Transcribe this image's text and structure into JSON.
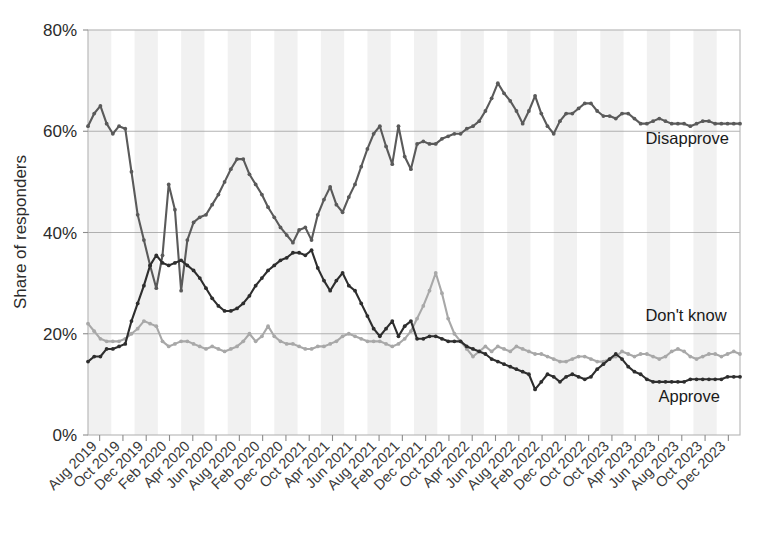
{
  "chart_data": {
    "type": "line",
    "title": "",
    "xlabel": "",
    "ylabel": "Share of responders",
    "ylim": [
      0,
      80
    ],
    "yticks": [
      0,
      20,
      40,
      60,
      80
    ],
    "ytick_labels": [
      "0%",
      "20%",
      "40%",
      "60%",
      "80%"
    ],
    "grid": true,
    "legend_position": "inline-right",
    "x_tick_labels": [
      "Aug 2019",
      "Oct 2019",
      "Dec 2019",
      "Feb 2020",
      "Apr 2020",
      "Jun 2020",
      "Aug 2020",
      "Feb 2020",
      "Dec 2020",
      "Oct 2021",
      "Apr 2021",
      "Jun 2021",
      "Aug 2021",
      "Feb 2021",
      "Dec 2021",
      "Oct 2022",
      "Apr 2022",
      "Jun 2022",
      "Aug 2022",
      "Feb 2022",
      "Dec 2022",
      "Oct 2022",
      "Oct 2023",
      "Apr 2023",
      "Jun 2023",
      "Aug 2023",
      "Oct 2023",
      "Dec 2023"
    ],
    "x_index": [
      0,
      1,
      2,
      3,
      4,
      5,
      6,
      7,
      8,
      9,
      10,
      11,
      12,
      13,
      14,
      15,
      16,
      17,
      18,
      19,
      20,
      21,
      22,
      23,
      24,
      25,
      26,
      27,
      28,
      29,
      30,
      31,
      32,
      33,
      34,
      35,
      36,
      37,
      38,
      39,
      40,
      41,
      42,
      43,
      44,
      45,
      46,
      47,
      48,
      49,
      50,
      51,
      52,
      53,
      54,
      55,
      56,
      57,
      58,
      59,
      60,
      61,
      62,
      63,
      64,
      65,
      66,
      67,
      68,
      69,
      70,
      71,
      72,
      73,
      74,
      75,
      76,
      77,
      78,
      79,
      80,
      81,
      82,
      83,
      84,
      85,
      86,
      87,
      88,
      89,
      90,
      91,
      92,
      93,
      94,
      95,
      96,
      97,
      98,
      99,
      100,
      101,
      102,
      103,
      104,
      105
    ],
    "series": [
      {
        "name": "Disapprove",
        "color": "#5a5a5a",
        "label_x_frac": 0.855,
        "label_y_value": 57.5,
        "values": [
          61.0,
          63.5,
          65.0,
          61.5,
          59.5,
          61.0,
          60.5,
          52.0,
          43.5,
          38.5,
          33.5,
          29.0,
          35.5,
          49.5,
          44.5,
          28.5,
          38.5,
          42.0,
          43.0,
          43.5,
          45.5,
          47.5,
          50.0,
          52.5,
          54.5,
          54.5,
          51.5,
          49.5,
          47.5,
          45.0,
          43.0,
          41.0,
          39.5,
          38.0,
          40.5,
          41.0,
          38.5,
          43.5,
          46.5,
          49.0,
          45.5,
          44.0,
          47.0,
          49.5,
          53.0,
          56.5,
          59.5,
          61.0,
          57.0,
          53.5,
          61.0,
          55.0,
          52.5,
          57.5,
          58.0,
          57.5,
          57.5,
          58.5,
          59.0,
          59.5,
          59.5,
          60.5,
          61.0,
          62.0,
          64.0,
          66.5,
          69.5,
          67.5,
          66.0,
          64.0,
          61.5,
          64.0,
          67.0,
          63.5,
          61.0,
          59.5,
          62.0,
          63.5,
          63.5,
          64.5,
          65.5,
          65.5,
          64.0,
          63.0,
          63.0,
          62.5,
          63.5,
          63.5,
          62.5,
          61.5,
          61.5,
          62.0,
          62.5,
          62.0,
          61.5,
          61.5,
          61.5,
          61.0,
          61.5,
          62.0,
          62.0,
          61.5,
          61.5,
          61.5,
          61.5,
          61.5
        ]
      },
      {
        "name": "Don't know",
        "color": "#a8a8a8",
        "label_x_frac": 0.855,
        "label_y_value": 22.5,
        "values": [
          22.0,
          20.5,
          19.0,
          18.5,
          18.5,
          18.5,
          19.0,
          20.0,
          21.0,
          22.5,
          22.0,
          21.5,
          18.5,
          17.5,
          18.0,
          18.5,
          18.5,
          18.0,
          17.5,
          17.0,
          17.5,
          17.0,
          16.5,
          17.0,
          17.5,
          18.5,
          20.0,
          18.5,
          19.5,
          21.5,
          19.5,
          18.5,
          18.0,
          18.0,
          17.5,
          17.0,
          17.0,
          17.5,
          17.5,
          18.0,
          18.5,
          19.5,
          20.0,
          19.5,
          19.0,
          18.5,
          18.5,
          18.5,
          18.0,
          17.5,
          18.0,
          19.0,
          20.5,
          23.0,
          25.5,
          28.5,
          32.0,
          28.0,
          23.0,
          20.0,
          18.5,
          17.0,
          15.5,
          16.5,
          17.5,
          16.5,
          17.5,
          17.0,
          16.5,
          17.5,
          17.0,
          16.5,
          16.0,
          16.0,
          15.5,
          15.0,
          14.5,
          14.5,
          15.0,
          15.5,
          15.5,
          15.0,
          14.5,
          14.5,
          15.0,
          15.5,
          16.5,
          16.0,
          15.5,
          16.0,
          16.0,
          15.5,
          15.0,
          15.5,
          16.5,
          17.0,
          16.5,
          15.5,
          15.0,
          15.5,
          16.0,
          16.0,
          15.5,
          16.0,
          16.5,
          16.0
        ]
      },
      {
        "name": "Approve",
        "color": "#2e2e2e",
        "label_x_frac": 0.875,
        "label_y_value": 6.5,
        "values": [
          14.5,
          15.5,
          15.5,
          17.0,
          17.0,
          17.5,
          18.0,
          22.5,
          26.0,
          29.5,
          33.5,
          35.5,
          34.0,
          33.5,
          34.0,
          34.5,
          33.5,
          32.5,
          31.0,
          29.0,
          27.0,
          25.5,
          24.5,
          24.5,
          25.0,
          26.0,
          27.5,
          29.5,
          31.0,
          32.5,
          33.5,
          34.5,
          35.0,
          36.0,
          36.0,
          35.5,
          36.5,
          33.0,
          30.5,
          28.5,
          30.5,
          32.0,
          29.5,
          28.5,
          26.0,
          23.5,
          21.0,
          19.5,
          21.0,
          22.5,
          19.5,
          21.5,
          22.5,
          19.0,
          19.0,
          19.5,
          19.5,
          19.0,
          18.5,
          18.5,
          18.5,
          17.5,
          17.0,
          16.5,
          16.0,
          15.0,
          14.5,
          14.0,
          13.5,
          13.0,
          12.5,
          12.0,
          9.0,
          10.5,
          12.0,
          11.5,
          10.5,
          11.5,
          12.0,
          11.5,
          11.0,
          11.5,
          13.0,
          14.0,
          15.0,
          16.0,
          15.0,
          13.5,
          12.5,
          12.0,
          11.0,
          10.5,
          10.5,
          10.5,
          10.5,
          10.5,
          10.5,
          11.0,
          11.0,
          11.0,
          11.0,
          11.0,
          11.0,
          11.5,
          11.5,
          11.5
        ]
      }
    ]
  },
  "axis": {
    "y_title": "Share of responders"
  }
}
